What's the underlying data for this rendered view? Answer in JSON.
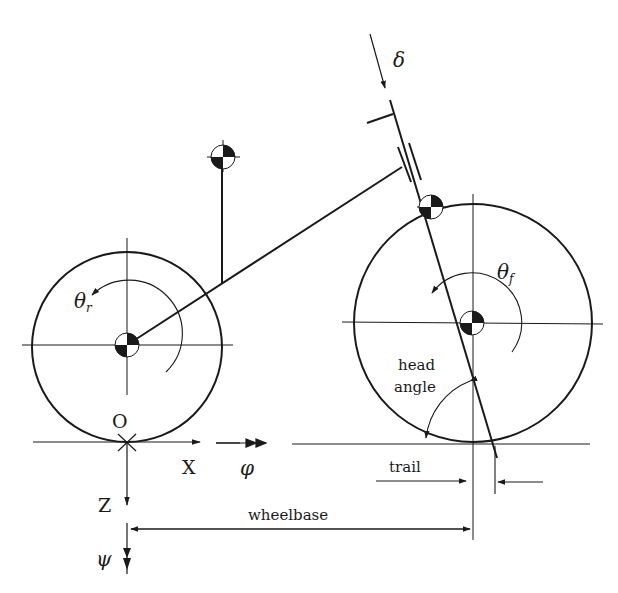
{
  "diagram": {
    "colors": {
      "line": "#1a1a1a",
      "background": "#ffffff"
    },
    "labels": {
      "origin": "O",
      "x_axis": "X",
      "z_axis": "Z",
      "roll": "φ",
      "yaw": "ψ",
      "steer": "δ",
      "theta_rear": "θ",
      "theta_rear_sub": "r",
      "theta_front": "θ",
      "theta_front_sub": "f",
      "head_angle_line1": "head",
      "head_angle_line2": "angle",
      "trail": "trail",
      "wheelbase": "wheelbase"
    },
    "components": [
      "rear-wheel",
      "front-wheel",
      "rear-frame",
      "rider-mass",
      "steering-axis",
      "front-fork-mass",
      "ground-line",
      "coordinate-axes",
      "wheelbase-dimension",
      "trail-dimension",
      "head-angle-arc"
    ]
  }
}
